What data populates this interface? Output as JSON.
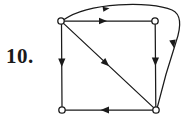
{
  "figure": {
    "kind": "directed-graph-diagram",
    "problem_number_label": "10.",
    "background_color": "#ffffff",
    "ink_color": "#1a1a1a",
    "stroke_width": 1.3,
    "canvas": {
      "width": 187,
      "height": 123
    }
  },
  "graph": {
    "vertex_radius": 3.2,
    "vertex_fill": "#ffffff",
    "vertices": [
      {
        "id": "v-top-left",
        "name": "top-left-vertex",
        "x": 61,
        "y": 21
      },
      {
        "id": "v-top-right",
        "name": "top-right-vertex",
        "x": 155,
        "y": 21
      },
      {
        "id": "v-bottom-left",
        "name": "bottom-left-vertex",
        "x": 62,
        "y": 110
      },
      {
        "id": "v-bottom-right",
        "name": "bottom-right-vertex",
        "x": 156,
        "y": 110
      }
    ],
    "edges": [
      {
        "id": "e-top",
        "name": "edge-top-left-to-top-right",
        "from": "v-top-left",
        "to": "v-top-right",
        "shape": "straight",
        "path": "M 64.2 21 L 151.8 21",
        "arrow": {
          "x": 102,
          "y": 21,
          "angle": 0
        }
      },
      {
        "id": "e-left",
        "name": "edge-top-left-to-bottom-left",
        "from": "v-top-left",
        "to": "v-bottom-left",
        "shape": "straight",
        "path": "M 61.5 24.2 L 62 106.8",
        "arrow": {
          "x": 61.8,
          "y": 62,
          "angle": 90
        }
      },
      {
        "id": "e-diagonal",
        "name": "edge-top-left-to-bottom-right",
        "from": "v-top-left",
        "to": "v-bottom-right",
        "shape": "straight",
        "path": "M 63.5 23.4 L 153.6 107.6",
        "arrow": {
          "x": 106,
          "y": 63,
          "angle": 43
        }
      },
      {
        "id": "e-right",
        "name": "edge-top-right-to-bottom-right",
        "from": "v-top-right",
        "to": "v-bottom-right",
        "shape": "straight",
        "path": "M 155.2 24.2 L 155.8 106.8",
        "arrow": {
          "x": 155.5,
          "y": 61,
          "angle": 90
        }
      },
      {
        "id": "e-bottom",
        "name": "edge-bottom-right-to-bottom-left",
        "from": "v-bottom-right",
        "to": "v-bottom-left",
        "shape": "straight",
        "path": "M 152.8 110 L 65.2 110",
        "arrow": {
          "x": 106,
          "y": 110,
          "angle": 180
        }
      },
      {
        "id": "e-curve",
        "name": "edge-top-left-to-bottom-right-curved",
        "from": "v-top-left",
        "to": "v-bottom-right",
        "shape": "curved-over-top",
        "path": "M 64.0 19.6 C 88 2.5, 150 0.5, 172 10 C 182 14.5, 181.5 26, 176 42 C 170 60, 161 92, 157.5 106.6",
        "arrows": [
          {
            "x": 103,
            "y": 9.2,
            "angle": -9
          },
          {
            "x": 172.5,
            "y": 41,
            "angle": 80
          }
        ]
      }
    ]
  }
}
